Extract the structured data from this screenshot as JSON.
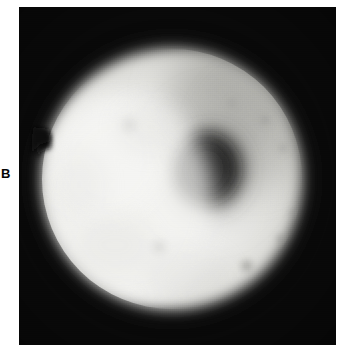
{
  "figure": {
    "panel_label": "B",
    "caption": "",
    "width_px": 343,
    "height_px": 357,
    "page_background": "#ffffff"
  },
  "micrograph": {
    "name": "grayscale-micrograph",
    "modality": "brightfield-light-micrograph",
    "frame": {
      "x": 19,
      "y": 7,
      "width": 317,
      "height": 338,
      "background_color": "#090909",
      "border_color": "#0b0b0b"
    },
    "background_color": "#0a0a0a",
    "alt_text": "Large round cell with a bright cytoplasm, a dark eccentric nucleus in the upper right, a diffuse gray zone along the upper right rim, a notch indentation on the left margin and several small dark vesicles in the lower right quadrant.",
    "features": [
      {
        "name": "cell-body",
        "label": "cell body",
        "shape": "circle",
        "cx": 153,
        "cy": 172,
        "r": 131,
        "fill_color": "#e8e8e6",
        "edge_softness_px": 14
      },
      {
        "name": "cytoplasm-bright-zone",
        "label": "bright cytoplasm",
        "shape": "ellipse",
        "cx": 120,
        "cy": 195,
        "rx": 96,
        "ry": 108,
        "fill_color": "#f2f2f0"
      },
      {
        "name": "nucleus",
        "label": "nucleus",
        "shape": "ellipse",
        "cx": 191,
        "cy": 164,
        "rx": 36,
        "ry": 40,
        "fill_color": "#2f2f2e",
        "edge_softness_px": 13
      },
      {
        "name": "perinuclear-halo",
        "label": "perinuclear gray zone",
        "shape": "ellipse",
        "cx": 196,
        "cy": 152,
        "rx": 70,
        "ry": 82,
        "fill_color": "#9a9a96"
      },
      {
        "name": "upper-right-gray-region",
        "label": "diffuse gray rim region",
        "shape": "ellipse",
        "cx": 208,
        "cy": 92,
        "rx": 74,
        "ry": 62,
        "fill_color": "#a8a8a4"
      },
      {
        "name": "membrane-notch",
        "label": "membrane notch",
        "shape": "notch",
        "x": 22,
        "y": 128,
        "width": 16,
        "height": 22,
        "fill_color": "#101010"
      },
      {
        "name": "vesicle-cluster",
        "label": "dark vesicles",
        "shape": "spots",
        "fill_color": "#8f8f8b",
        "points": [
          {
            "cx": 228,
            "cy": 259,
            "r": 7
          },
          {
            "cx": 262,
            "cy": 232,
            "r": 5
          },
          {
            "cx": 250,
            "cy": 283,
            "r": 5
          },
          {
            "cx": 232,
            "cy": 290,
            "r": 4
          },
          {
            "cx": 275,
            "cy": 206,
            "r": 4
          },
          {
            "cx": 246,
            "cy": 113,
            "r": 6
          },
          {
            "cx": 262,
            "cy": 141,
            "r": 5
          },
          {
            "cx": 213,
            "cy": 96,
            "r": 5
          }
        ]
      }
    ]
  }
}
